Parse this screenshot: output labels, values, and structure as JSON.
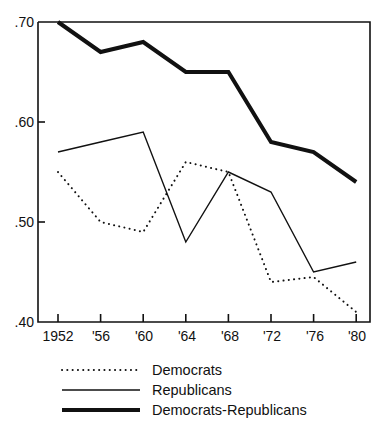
{
  "chart_data": {
    "type": "line",
    "title": "",
    "subtitle": "",
    "xlabel": "",
    "ylabel": "",
    "x": [
      1952,
      1956,
      1960,
      1964,
      1968,
      1972,
      1976,
      1980
    ],
    "xtick_labels": [
      "1952",
      "'56",
      "'60",
      "'64",
      "'68",
      "'72",
      "'76",
      "'80"
    ],
    "ytick_labels": [
      ".70",
      ".60",
      ".50",
      ".40"
    ],
    "ytick_values": [
      0.7,
      0.6,
      0.5,
      0.4
    ],
    "ylim": [
      0.4,
      0.7
    ],
    "xlim": [
      1950.5,
      1982
    ],
    "grid": false,
    "legend_position": "below-axes-left",
    "series": [
      {
        "name": "Democrats",
        "style": "dotted",
        "color": "#111111",
        "width": 2,
        "values": [
          0.55,
          0.5,
          0.49,
          0.56,
          0.55,
          0.44,
          0.445,
          0.41
        ]
      },
      {
        "name": "Republicans",
        "style": "solid-thin",
        "color": "#111111",
        "width": 1.4,
        "values": [
          0.57,
          0.58,
          0.59,
          0.48,
          0.55,
          0.53,
          0.45,
          0.46
        ]
      },
      {
        "name": "Democrats-Republicans",
        "style": "solid-thick",
        "color": "#111111",
        "width": 4,
        "values": [
          0.7,
          0.67,
          0.68,
          0.65,
          0.65,
          0.58,
          0.57,
          0.54
        ]
      }
    ]
  },
  "legend": {
    "items": [
      {
        "label": "Democrats",
        "style": "dotted"
      },
      {
        "label": "Republicans",
        "style": "solid-thin"
      },
      {
        "label": "Democrats-Republicans",
        "style": "solid-thick"
      }
    ]
  },
  "axes": {
    "y_labels": [
      {
        "text": ".70",
        "y": 0.7
      },
      {
        "text": ".60",
        "y": 0.6
      },
      {
        "text": ".50",
        "y": 0.5
      },
      {
        "text": ".40",
        "y": 0.4
      }
    ],
    "x_labels": [
      "1952",
      "'56",
      "'60",
      "'64",
      "'68",
      "'72",
      "'76",
      "'80"
    ]
  }
}
